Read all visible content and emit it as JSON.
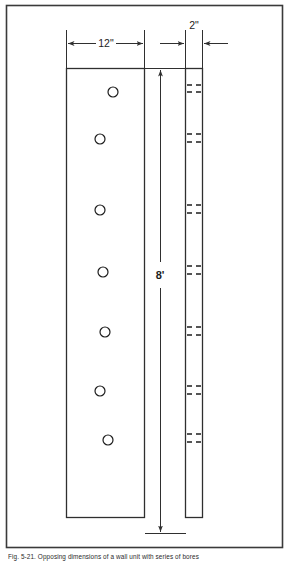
{
  "figure": {
    "caption": "Fig. 5-21.  Opposing dimensions of a wall unit with series of bores",
    "frame": {
      "x": 6,
      "y": 5,
      "width": 277,
      "height": 543,
      "color": "#3a3a3a"
    },
    "line_color": "#2f2f2f",
    "fill_color": "#ffffff"
  },
  "dimensions": {
    "width_label": "12\"",
    "thickness_label": "2\"",
    "height_label": "8'"
  },
  "front_panel": {
    "name": "wall-unit-front-view",
    "x": 66,
    "y": 68,
    "width": 78,
    "height": 449,
    "bore_radius": 5.0,
    "bores": [
      {
        "cx": 113,
        "cy": 92
      },
      {
        "cx": 100,
        "cy": 139
      },
      {
        "cx": 100,
        "cy": 210
      },
      {
        "cx": 103,
        "cy": 272
      },
      {
        "cx": 105,
        "cy": 332
      },
      {
        "cx": 100,
        "cy": 391
      },
      {
        "cx": 108,
        "cy": 440
      }
    ]
  },
  "edge_panel": {
    "name": "wall-unit-edge-view",
    "x": 185,
    "y": 68,
    "width": 17,
    "height": 449,
    "bore_marks": [
      {
        "y": 85
      },
      {
        "y": 92
      },
      {
        "y": 134
      },
      {
        "y": 142
      },
      {
        "y": 205
      },
      {
        "y": 213
      },
      {
        "y": 266
      },
      {
        "y": 274
      },
      {
        "y": 327
      },
      {
        "y": 335
      },
      {
        "y": 386
      },
      {
        "y": 394
      },
      {
        "y": 434
      },
      {
        "y": 442
      }
    ]
  },
  "vertical_dimension": {
    "x": 160,
    "top": 68,
    "bottom": 533,
    "label_y": 275
  },
  "horizontal_dimensions": {
    "width_dim": {
      "left": 66,
      "right": 144,
      "y": 43
    },
    "thickness_dim": {
      "left": 185,
      "right": 202,
      "y": 43,
      "label_y": 26
    }
  }
}
